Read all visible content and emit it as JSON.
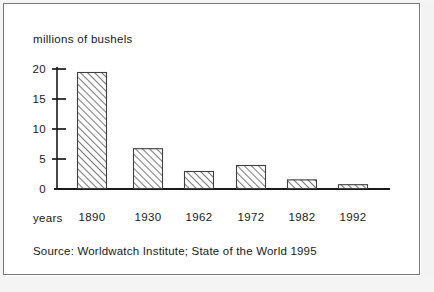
{
  "figure": {
    "title": "millions of bushels",
    "source_note": "Source: Worldwatch Institute; State of the World 1995",
    "x_axis_name": "years",
    "frame_color": "#7a7a7a",
    "ink_color": "#1a1a1a",
    "bar_fill": "#ffffff",
    "bar_hatch_color": "#707070",
    "bar_edge_color": "#404040"
  },
  "chart_data": {
    "type": "bar",
    "title": "millions of bushels",
    "xlabel": "years",
    "ylabel": "millions of bushels",
    "categories": [
      "1890",
      "1930",
      "1962",
      "1972",
      "1982",
      "1992"
    ],
    "values": [
      19.5,
      6.8,
      3.0,
      4.0,
      1.6,
      0.8
    ],
    "ylim": [
      0,
      20
    ],
    "yticks": [
      0,
      5,
      10,
      15,
      20
    ],
    "ytick_labels": [
      "0",
      "5",
      "10",
      "15",
      "20"
    ],
    "grid": false,
    "legend": "none",
    "annotation": "Source: Worldwatch Institute; State of the World 1995"
  }
}
